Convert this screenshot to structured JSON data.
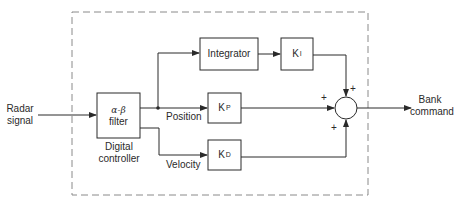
{
  "diagram": {
    "type": "block-diagram",
    "title": "",
    "input": {
      "label_line1": "Radar",
      "label_line2": "signal"
    },
    "output": {
      "label_line1": "Bank",
      "label_line2": "command"
    },
    "controller_boundary": {
      "style": "dashed",
      "label": ""
    },
    "blocks": {
      "filter": {
        "line1": "α-β",
        "line2": "filter",
        "caption_line1": "Digital",
        "caption_line2": "controller"
      },
      "integrator": {
        "label": "Integrator"
      },
      "ki": {
        "base": "K",
        "sub": "I"
      },
      "kp": {
        "base": "K",
        "sub": "P"
      },
      "kd": {
        "base": "K",
        "sub": "D"
      }
    },
    "signals": {
      "position": "Position",
      "velocity": "Velocity"
    },
    "summing_junction": {
      "signs": {
        "top": "+",
        "left": "+",
        "bottom": "+"
      }
    },
    "colors": {
      "line": "#2a2a2a",
      "dashed": "#8a8a8a",
      "background": "#ffffff"
    }
  }
}
